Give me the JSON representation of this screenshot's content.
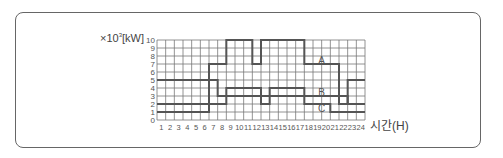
{
  "chart_data": {
    "type": "line",
    "title": "",
    "ylabel_prefix": "×10",
    "ylabel_exp": "3",
    "ylabel_unit": "[kW]",
    "xlabel": "시간(H)",
    "x": [
      1,
      2,
      3,
      4,
      5,
      6,
      7,
      8,
      9,
      10,
      11,
      12,
      13,
      14,
      15,
      16,
      17,
      18,
      19,
      20,
      21,
      22,
      23,
      24
    ],
    "xlim": [
      0,
      24
    ],
    "ylim": [
      0,
      10
    ],
    "yticks": [
      0,
      1,
      2,
      3,
      4,
      5,
      6,
      7,
      8,
      9,
      10
    ],
    "grid": true,
    "step": true,
    "series": [
      {
        "name": "A",
        "values": [
          1,
          1,
          1,
          1,
          1,
          1,
          7,
          7,
          10,
          10,
          10,
          7,
          10,
          10,
          10,
          10,
          10,
          7,
          7,
          7,
          7,
          2,
          5,
          5
        ]
      },
      {
        "name": "B",
        "values": [
          5,
          5,
          5,
          5,
          5,
          5,
          5,
          3,
          4,
          4,
          4,
          4,
          2,
          4,
          4,
          4,
          4,
          3,
          3,
          3,
          3,
          3,
          2,
          2
        ]
      },
      {
        "name": "C",
        "values": [
          2,
          2,
          2,
          2,
          2,
          2,
          2,
          2,
          3,
          3,
          3,
          3,
          3,
          3,
          3,
          3,
          3,
          2,
          2,
          2,
          1,
          1,
          1,
          1
        ]
      }
    ],
    "annotations": [
      {
        "text": "A",
        "x": 19,
        "y": 7.5
      },
      {
        "text": "B",
        "x": 19,
        "y": 3.5
      },
      {
        "text": "C",
        "x": 19,
        "y": 1.5
      }
    ]
  }
}
